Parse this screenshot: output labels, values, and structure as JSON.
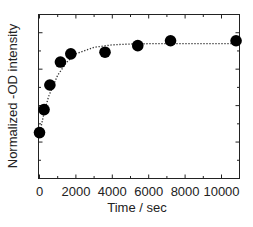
{
  "chart_data": {
    "type": "scatter",
    "title": "",
    "xlabel": "Time / sec",
    "ylabel": "Normalized -OD intensity",
    "xlim": [
      0,
      11000
    ],
    "ylim": [
      0,
      1
    ],
    "x_ticks": [
      0,
      2000,
      4000,
      6000,
      8000,
      10000
    ],
    "x_tick_labels": [
      "0",
      "2000",
      "4000",
      "6000",
      "8000",
      "10000"
    ],
    "x_minor_ticks": [
      1000,
      3000,
      5000,
      7000,
      9000
    ],
    "y_tick_labels": [],
    "y_ticks_count": 9,
    "grid": false,
    "legend": null,
    "series": [
      {
        "name": "data",
        "marker": "filled-circle",
        "color": "#000000",
        "x": [
          0,
          250,
          570,
          1150,
          1720,
          3600,
          5400,
          7200,
          10800
        ],
        "y": [
          0.28,
          0.42,
          0.57,
          0.71,
          0.76,
          0.77,
          0.81,
          0.84,
          0.84
        ]
      },
      {
        "name": "fit",
        "style": "dotted-line",
        "color": "#333333",
        "x": [
          0,
          250,
          500,
          1000,
          1500,
          2000,
          3000,
          4000,
          5000,
          6000,
          8000,
          11000
        ],
        "y": [
          0.27,
          0.4,
          0.5,
          0.63,
          0.71,
          0.76,
          0.8,
          0.815,
          0.82,
          0.822,
          0.823,
          0.823
        ]
      }
    ]
  }
}
